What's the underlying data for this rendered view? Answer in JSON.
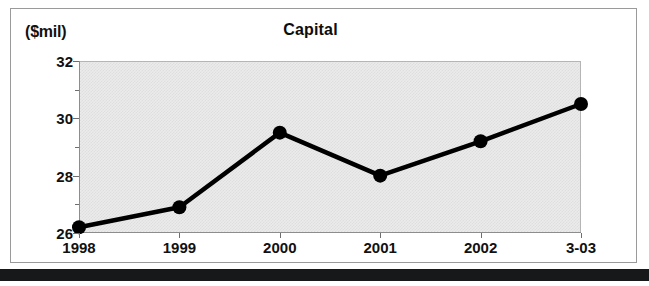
{
  "chart_data": {
    "type": "line",
    "title": "Capital",
    "ylabel": "($mil)",
    "xlabel": "",
    "categories": [
      "1998",
      "1999",
      "2000",
      "2001",
      "2002",
      "3-03"
    ],
    "values": [
      26.2,
      26.9,
      29.5,
      28.0,
      29.2,
      30.5
    ],
    "series": [
      {
        "name": "Capital",
        "values": [
          26.2,
          26.9,
          29.5,
          28.0,
          29.2,
          30.5
        ]
      }
    ],
    "ylim": [
      26,
      32
    ],
    "yticks": [
      26,
      28,
      30,
      32
    ],
    "ytick_labels": [
      "26",
      "28",
      "30",
      "32"
    ],
    "yminor_ticks": [
      27,
      29,
      31
    ],
    "grid": false,
    "legend": null,
    "marker": "filled-circle",
    "line_color": "#000000",
    "marker_color": "#000000",
    "plot_background": "#ebebeb"
  },
  "axis": {
    "unit_label": "($mil)"
  },
  "title": {
    "text": "Capital"
  }
}
